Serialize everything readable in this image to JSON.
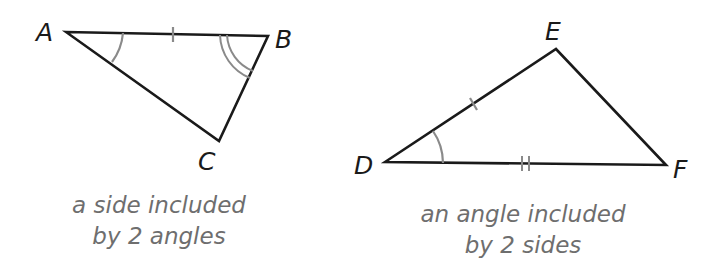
{
  "figure_1": {
    "vertices": {
      "A": {
        "label": "A"
      },
      "B": {
        "label": "B"
      },
      "C": {
        "label": "C"
      }
    },
    "caption_line1": "a side included",
    "caption_line2": "by 2 angles"
  },
  "figure_2": {
    "vertices": {
      "D": {
        "label": "D"
      },
      "E": {
        "label": "E"
      },
      "F": {
        "label": "F"
      }
    },
    "caption_line1": "an angle included",
    "caption_line2": "by 2 sides"
  },
  "colors": {
    "line": "#1a1a1a",
    "mark": "#8a8a8a",
    "caption": "#6e6e6e"
  }
}
